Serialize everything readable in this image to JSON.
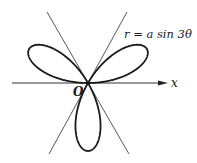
{
  "figure": {
    "equation_label": "r = a sin 3θ",
    "x_axis_label": "x",
    "origin_label": "O",
    "curve": "three-leaved rose",
    "colors": {
      "curve": "#1a1a1a",
      "axes": "#333333",
      "background": "#ffffff"
    }
  }
}
